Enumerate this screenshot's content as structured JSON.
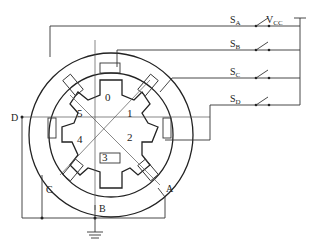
{
  "diagram": {
    "type": "stepper-motor-wiring",
    "supply_label": "V",
    "supply_sub": "CC",
    "switches": [
      {
        "main": "S",
        "sub": "A"
      },
      {
        "main": "S",
        "sub": "B"
      },
      {
        "main": "S",
        "sub": "C"
      },
      {
        "main": "S",
        "sub": "D"
      }
    ],
    "phases": [
      "A",
      "B",
      "C",
      "D"
    ],
    "rotor_teeth": [
      "0",
      "1",
      "2",
      "3",
      "4",
      "5"
    ],
    "ground": "ground"
  }
}
